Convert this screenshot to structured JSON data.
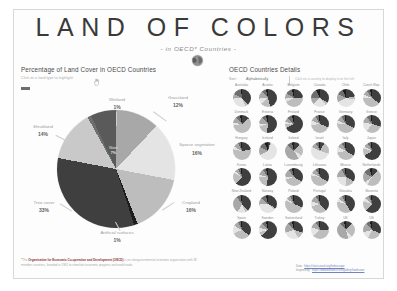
{
  "header": {
    "title": "LAND OF COLORS",
    "subtitle": "- in OECD* Countries -",
    "globe_icon": "globe-icon"
  },
  "left_panel": {
    "title": "Percentage of Land Cover in OECD Countries",
    "hint": "Click on a land type to highlight",
    "cursor_icon": "hand-pointer-icon"
  },
  "right_panel": {
    "title": "OECD Countries Details",
    "sort_label": "Sort :",
    "sort_value": "Alphabetically",
    "hint": "Click on a country to display it on the left"
  },
  "footnote": {
    "star": "*",
    "lead": "The ",
    "bold": "Organisation for Economic Co-operation and Development (OECD)",
    "rest": " is an intergovernmental economic organisation with 38 member countries, founded in 1961 to stimulate economic progress and world trade."
  },
  "sources": [
    {
      "key": "Data :",
      "link": "https://stats.oecd.org/Index.aspx"
    },
    {
      "key": "Inspired by :",
      "link": "https://www.behance.net/gallery/landcover"
    }
  ],
  "chart_data": {
    "type": "pie",
    "title": "Percentage of Land Cover in OECD Countries",
    "unit": "%",
    "legend_position": "labels-around-pie",
    "categories": [
      "Tree cover",
      "Cropland",
      "Sparse vegetation",
      "Grassland",
      "Shrubland",
      "Wetland",
      "Water",
      "Artificial surfaces"
    ],
    "values": [
      33,
      16,
      16,
      12,
      14,
      1,
      7,
      1
    ],
    "labels": [
      {
        "name": "Wetland",
        "value": 1,
        "display": "1%",
        "placement": "top"
      },
      {
        "name": "Grassland",
        "value": 12,
        "display": "12%",
        "placement": "top-right"
      },
      {
        "name": "Sparse vegetation",
        "value": 16,
        "display": "16%",
        "placement": "right"
      },
      {
        "name": "Cropland",
        "value": 16,
        "display": "16%",
        "placement": "bottom-right"
      },
      {
        "name": "Artificial surfaces",
        "value": 1,
        "display": "1%",
        "placement": "bottom"
      },
      {
        "name": "Tree cover",
        "value": 33,
        "display": "33%",
        "placement": "bottom-left"
      },
      {
        "name": "Shrubland",
        "value": 14,
        "display": "14%",
        "placement": "left"
      },
      {
        "name": "Water",
        "value": 7,
        "display": "7%",
        "placement": "inner"
      }
    ],
    "colors": {
      "tree_cover": "#3f3f3f",
      "cropland": "#bdbdbd",
      "sparse_vegetation": "#e4e4e4",
      "grassland": "#a8a8a8",
      "shrubland": "#c9c9c9",
      "wetland": "#6e6e6e",
      "water": "#5a5a5a",
      "artificial_surfaces": "#1c1c1c"
    }
  },
  "countries": [
    {
      "name": "Australia",
      "slices": [
        38,
        6,
        30,
        8,
        16,
        2
      ]
    },
    {
      "name": "Austria",
      "slices": [
        46,
        18,
        10,
        14,
        8,
        4
      ]
    },
    {
      "name": "Belgium",
      "slices": [
        24,
        44,
        6,
        10,
        12,
        4
      ]
    },
    {
      "name": "Canada",
      "slices": [
        34,
        5,
        24,
        12,
        18,
        7
      ]
    },
    {
      "name": "Chile",
      "slices": [
        22,
        6,
        40,
        14,
        12,
        6
      ]
    },
    {
      "name": "Czech Rep.",
      "slices": [
        35,
        40,
        6,
        9,
        6,
        4
      ]
    },
    {
      "name": "Denmark",
      "slices": [
        14,
        58,
        5,
        11,
        8,
        4
      ]
    },
    {
      "name": "Estonia",
      "slices": [
        52,
        18,
        6,
        12,
        8,
        4
      ]
    },
    {
      "name": "Finland",
      "slices": [
        68,
        7,
        4,
        8,
        9,
        4
      ]
    },
    {
      "name": "France",
      "slices": [
        31,
        42,
        8,
        10,
        6,
        3
      ]
    },
    {
      "name": "Germany",
      "slices": [
        32,
        44,
        5,
        10,
        6,
        3
      ]
    },
    {
      "name": "Greece",
      "slices": [
        30,
        30,
        18,
        12,
        7,
        3
      ]
    },
    {
      "name": "Hungary",
      "slices": [
        22,
        56,
        5,
        10,
        4,
        3
      ]
    },
    {
      "name": "Iceland",
      "slices": [
        4,
        2,
        62,
        14,
        12,
        6
      ]
    },
    {
      "name": "Ireland",
      "slices": [
        11,
        22,
        8,
        46,
        9,
        4
      ]
    },
    {
      "name": "Israel",
      "slices": [
        8,
        22,
        52,
        10,
        5,
        3
      ]
    },
    {
      "name": "Italy",
      "slices": [
        34,
        38,
        10,
        10,
        5,
        3
      ]
    },
    {
      "name": "Japan",
      "slices": [
        66,
        14,
        4,
        8,
        5,
        3
      ]
    },
    {
      "name": "Korea",
      "slices": [
        62,
        20,
        4,
        7,
        4,
        3
      ]
    },
    {
      "name": "Latvia",
      "slices": [
        53,
        22,
        4,
        11,
        6,
        4
      ]
    },
    {
      "name": "Luxembourg",
      "slices": [
        34,
        36,
        6,
        14,
        6,
        4
      ]
    },
    {
      "name": "Lithuania",
      "slices": [
        34,
        44,
        4,
        10,
        5,
        3
      ]
    },
    {
      "name": "Mexico",
      "slices": [
        33,
        18,
        24,
        16,
        6,
        3
      ]
    },
    {
      "name": "Netherlands",
      "slices": [
        11,
        48,
        6,
        18,
        12,
        5
      ]
    },
    {
      "name": "New Zealand",
      "slices": [
        38,
        6,
        14,
        32,
        7,
        3
      ]
    },
    {
      "name": "Norway",
      "slices": [
        33,
        3,
        38,
        12,
        10,
        4
      ]
    },
    {
      "name": "Poland",
      "slices": [
        31,
        50,
        4,
        8,
        4,
        3
      ]
    },
    {
      "name": "Portugal",
      "slices": [
        38,
        32,
        10,
        12,
        5,
        3
      ]
    },
    {
      "name": "Slovakia",
      "slices": [
        41,
        38,
        6,
        8,
        4,
        3
      ]
    },
    {
      "name": "Slovenia",
      "slices": [
        62,
        18,
        6,
        8,
        4,
        2
      ]
    },
    {
      "name": "Spain",
      "slices": [
        35,
        34,
        14,
        10,
        4,
        3
      ]
    },
    {
      "name": "Sweden",
      "slices": [
        64,
        7,
        8,
        9,
        8,
        4
      ]
    },
    {
      "name": "Switzerland",
      "slices": [
        30,
        12,
        28,
        18,
        8,
        4
      ]
    },
    {
      "name": "Turkey",
      "slices": [
        24,
        40,
        16,
        12,
        5,
        3
      ]
    },
    {
      "name": "UK",
      "slices": [
        12,
        26,
        8,
        42,
        8,
        4
      ]
    },
    {
      "name": "US",
      "slices": [
        31,
        26,
        14,
        18,
        7,
        4
      ]
    }
  ]
}
